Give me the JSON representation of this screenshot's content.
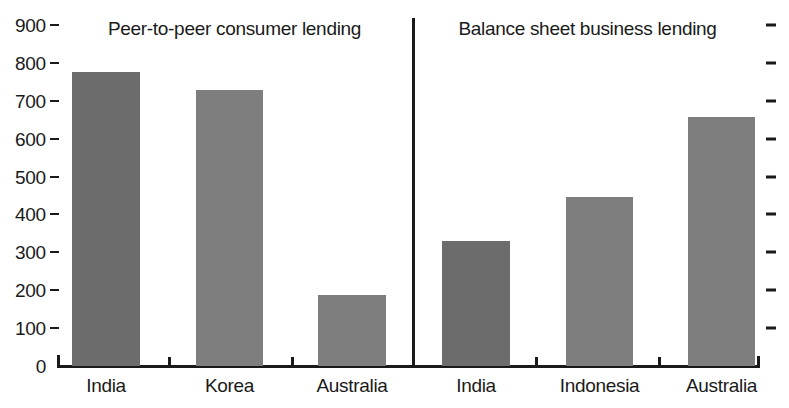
{
  "chart_data": {
    "type": "bar",
    "title": "",
    "subtitle": "",
    "xlabel": "",
    "ylabel": "",
    "ylim": [
      0,
      900
    ],
    "ytick_values": [
      0,
      100,
      200,
      300,
      400,
      500,
      600,
      700,
      800,
      900
    ],
    "ytick_labels": [
      "0",
      "100",
      "200",
      "300",
      "400",
      "500",
      "600",
      "700",
      "800",
      "900"
    ],
    "grid": false,
    "legend": false,
    "legend_position": "none",
    "right_axis_ticks": true,
    "right_axis_labels": false,
    "panels": [
      {
        "name": "panel-peer-to-peer",
        "title": "Peer-to-peer consumer lending",
        "categories": [
          "India",
          "Korea",
          "Australia"
        ],
        "values": [
          775,
          728,
          187
        ],
        "colors": [
          "#6c6c6c",
          "#7e7e7e",
          "#7e7e7e"
        ]
      },
      {
        "name": "panel-balance-sheet",
        "title": "Balance sheet business lending",
        "categories": [
          "India",
          "Indonesia",
          "Australia"
        ],
        "values": [
          330,
          445,
          657
        ],
        "colors": [
          "#6c6c6c",
          "#7e7e7e",
          "#7e7e7e"
        ]
      }
    ],
    "categories": [
      "India",
      "Korea",
      "Australia",
      "India",
      "Indonesia",
      "Australia"
    ],
    "values": [
      775,
      728,
      187,
      330,
      445,
      657
    ],
    "axis_color": "#1a1a1a",
    "background_color": "#ffffff"
  },
  "axis": {
    "y_labels": [
      "900",
      "800",
      "700",
      "600",
      "500",
      "400",
      "300",
      "200",
      "100",
      "0"
    ]
  },
  "panel_titles": {
    "left": "Peer-to-peer consumer lending",
    "right": "Balance sheet business lending"
  },
  "category_labels": {
    "c0": "India",
    "c1": "Korea",
    "c2": "Australia",
    "c3": "India",
    "c4": "Indonesia",
    "c5": "Australia"
  }
}
